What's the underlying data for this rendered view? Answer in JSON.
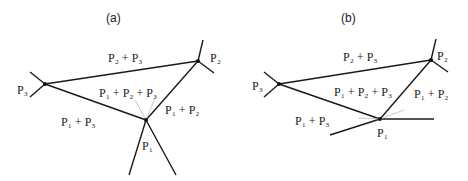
{
  "panels": [
    {
      "title": "(a)",
      "labels": {
        "p3": "P₃",
        "p2": "P₂",
        "p1": "P₁",
        "p2p3": "P₂ + P₃",
        "p1p2p3": "P₁ + P₂ + P₃",
        "p1p2": "P₁ + P₂",
        "p1p3": "P₁ + P₃"
      }
    },
    {
      "title": "(b)",
      "labels": {
        "p3": "P₃",
        "p2": "P₂",
        "p1": "P₁",
        "p2p3": "P₂ + P₃",
        "p1p2p3": "P₁ + P₂ + P₃",
        "p1p2": "P₁ + P₂",
        "p1p3": "P₁ + P₃"
      }
    }
  ],
  "colors": {
    "line": "#1a1a1a",
    "faint": "#bbbbbb",
    "text": "#222222"
  }
}
